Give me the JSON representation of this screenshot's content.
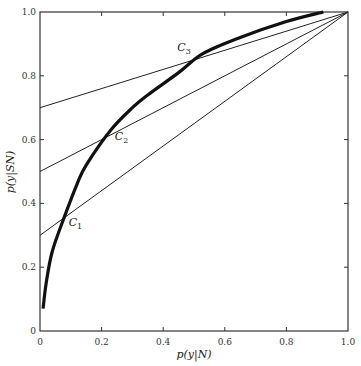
{
  "chart_data": {
    "type": "line",
    "title": "",
    "xlabel": "p(y|N)",
    "ylabel": "p(y|SN)",
    "xlim": [
      0,
      1.0
    ],
    "ylim": [
      0,
      1.0
    ],
    "grid": false,
    "x_ticks": [
      "0",
      "0.2",
      "0.4",
      "0.6",
      "0.8",
      "1.0"
    ],
    "y_ticks": [
      "0",
      "0.2",
      "0.4",
      "0.6",
      "0.8",
      "1.0"
    ],
    "series": [
      {
        "name": "ROC curve",
        "style": "thick",
        "x": [
          0.01,
          0.02,
          0.04,
          0.08,
          0.12,
          0.15,
          0.23,
          0.3,
          0.35,
          0.45,
          0.53,
          0.65,
          0.8,
          0.92
        ],
        "y": [
          0.07,
          0.15,
          0.25,
          0.36,
          0.46,
          0.52,
          0.63,
          0.7,
          0.74,
          0.81,
          0.87,
          0.92,
          0.97,
          1.0
        ]
      },
      {
        "name": "criterion line 1",
        "style": "thin",
        "x": [
          0,
          1.0
        ],
        "y": [
          0.3,
          1.0
        ]
      },
      {
        "name": "criterion line 2",
        "style": "thin",
        "x": [
          0,
          1.0
        ],
        "y": [
          0.5,
          1.0
        ]
      },
      {
        "name": "criterion line 3",
        "style": "thin",
        "x": [
          0,
          1.0
        ],
        "y": [
          0.7,
          1.0
        ]
      }
    ],
    "annotations": [
      {
        "label": "C",
        "sub": "1",
        "x": 0.08,
        "y": 0.36
      },
      {
        "label": "C",
        "sub": "2",
        "x": 0.23,
        "y": 0.63
      },
      {
        "label": "C",
        "sub": "3",
        "x": 0.53,
        "y": 0.87
      }
    ]
  }
}
